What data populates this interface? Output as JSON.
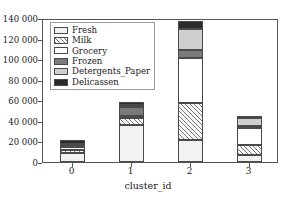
{
  "chart_data": {
    "type": "bar",
    "subtype": "stacked",
    "title": "",
    "xlabel": "cluster_id",
    "ylabel": "",
    "categories": [
      "0",
      "1",
      "2",
      "3"
    ],
    "ylim": [
      0,
      140000
    ],
    "yticks": [
      0,
      20000,
      40000,
      60000,
      80000,
      100000,
      120000,
      140000
    ],
    "ytick_labels": [
      "0",
      "20 000",
      "40 000",
      "60 000",
      "80 000",
      "100 000",
      "120 000",
      "140 000"
    ],
    "xtick_labels": [
      "0",
      "1",
      "2",
      "3"
    ],
    "grid": false,
    "legend_position": "upper left",
    "series": [
      {
        "name": "Fresh",
        "pattern": "dots",
        "color": "#f2f2f2",
        "values": [
          9000,
          36000,
          21000,
          6500
        ]
      },
      {
        "name": "Milk",
        "pattern": "diagonal-hatch",
        "color": "#fafafa",
        "values": [
          2500,
          6500,
          36000,
          10000
        ]
      },
      {
        "name": "Grocery",
        "pattern": "solid-white",
        "color": "#ffffff",
        "values": [
          3000,
          2000,
          44000,
          17000
        ]
      },
      {
        "name": "Frozen",
        "pattern": "solid-dark-gray",
        "color": "#7a7a7a",
        "values": [
          2000,
          9000,
          8000,
          2000
        ]
      },
      {
        "name": "Detergents_Paper",
        "pattern": "solid-light-gray",
        "color": "#cfcfcf",
        "values": [
          1500,
          1500,
          20000,
          7000
        ]
      },
      {
        "name": "Delicassen",
        "pattern": "solid-black",
        "color": "#2b2b2b",
        "values": [
          3000,
          3000,
          8000,
          1000
        ]
      }
    ],
    "totals": [
      21000,
      58000,
      137000,
      43500
    ]
  },
  "legend": {
    "items": [
      {
        "label": "Fresh"
      },
      {
        "label": "Milk"
      },
      {
        "label": "Grocery"
      },
      {
        "label": "Frozen"
      },
      {
        "label": "Detergents_Paper"
      },
      {
        "label": "Delicassen"
      }
    ]
  },
  "axes": {
    "x_axis_label": "cluster_id"
  }
}
